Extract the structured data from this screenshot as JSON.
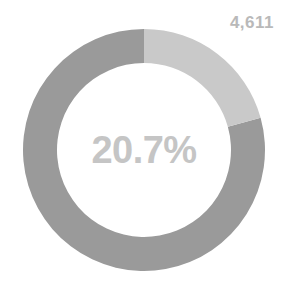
{
  "chart_data": {
    "type": "pie",
    "variant": "donut",
    "title": "",
    "subtitle": "",
    "xlabel": "",
    "ylabel": "",
    "center_label": "20.7%",
    "value_label": "4,611",
    "total_value": 4611,
    "legend": false,
    "grid": false,
    "start_angle_deg": 0,
    "direction": "clockwise",
    "geometry": {
      "center_x": 144,
      "center_y": 150,
      "outer_radius": 121,
      "inner_radius": 87,
      "ring_thickness": 34
    },
    "categories": [
      "Highlighted",
      "Remainder"
    ],
    "values": [
      20.7,
      79.3
    ],
    "unit": "%",
    "slices": [
      {
        "name": "Highlighted",
        "percent": 20.7,
        "value": 4611,
        "color": "#c9c9c9",
        "start_angle_deg": 0,
        "sweep_deg": 74.52
      },
      {
        "name": "Remainder",
        "percent": 79.3,
        "value": null,
        "color": "#9a9a9a",
        "start_angle_deg": 74.52,
        "sweep_deg": 285.48
      }
    ]
  },
  "colors": {
    "background": "#ffffff",
    "highlight_segment": "#c9c9c9",
    "remainder_segment": "#9a9a9a",
    "center_text": "#c5c5c5",
    "value_text": "#b9b9b9"
  }
}
